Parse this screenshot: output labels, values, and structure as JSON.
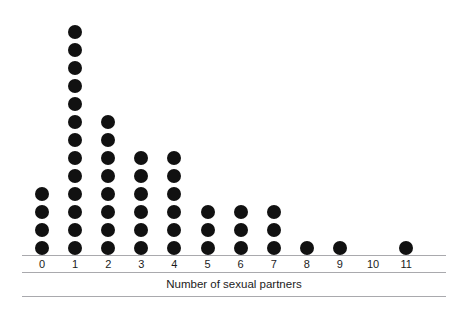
{
  "chart_data": {
    "type": "dot-plot",
    "title": "",
    "subtitle": "",
    "xlabel": "Number of sexual partners",
    "ylabel": "",
    "categories": [
      "0",
      "1",
      "2",
      "3",
      "4",
      "5",
      "6",
      "7",
      "8",
      "9",
      "10",
      "11"
    ],
    "values": [
      4,
      13,
      8,
      6,
      6,
      3,
      3,
      3,
      1,
      1,
      0,
      1
    ],
    "total_observations": 45,
    "dot_represents": 1,
    "grid": false,
    "legend": null,
    "ylim": [
      0,
      13
    ],
    "colors": {
      "dot": "#111111",
      "rule": "#a9a9ad",
      "text": "#1b1b1b",
      "background": "#ffffff"
    },
    "axis_rules": 3
  },
  "axis": {
    "title": "Number of sexual partners",
    "tick_labels": [
      "0",
      "1",
      "2",
      "3",
      "4",
      "5",
      "6",
      "7",
      "8",
      "9",
      "10",
      "11"
    ]
  }
}
